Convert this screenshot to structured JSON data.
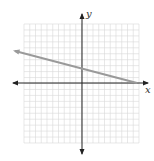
{
  "graph": {
    "x_axis_label": "x",
    "y_axis_label": "y",
    "grid": {
      "x_min": -10,
      "x_max": 10,
      "y_min": -10,
      "y_max": 10,
      "step": 1
    },
    "line": {
      "slope": -0.3333,
      "y_intercept": 3,
      "color": "#9a9a9a"
    },
    "colors": {
      "grid": "#d9d9d9",
      "axis": "#222222",
      "background": "#ffffff"
    }
  },
  "chart_data": {
    "type": "line",
    "title": "",
    "xlabel": "x",
    "ylabel": "y",
    "xlim": [
      -10,
      10
    ],
    "ylim": [
      -10,
      10
    ],
    "grid": true,
    "series": [
      {
        "name": "line",
        "x": [
          -11.5,
          9
        ],
        "values": [
          6.8,
          0
        ]
      }
    ]
  }
}
